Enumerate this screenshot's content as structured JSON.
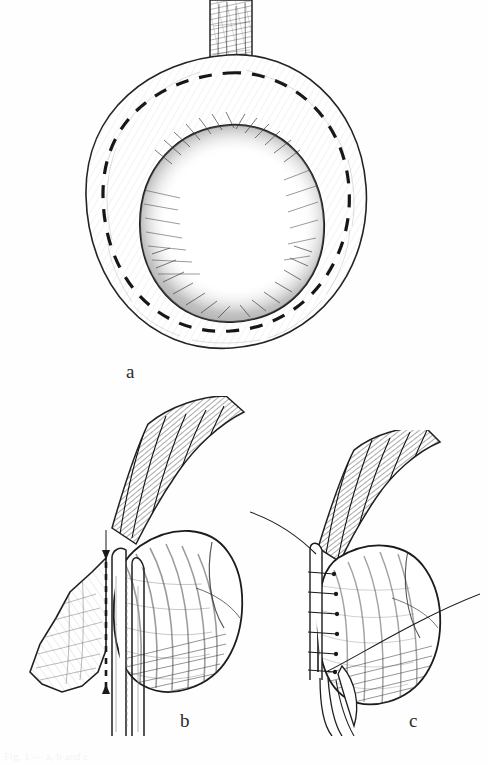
{
  "figure": {
    "kind": "surgical-line-drawing",
    "style": "pen-and-ink hatched anatomical illustration",
    "background_color": "#ffffff",
    "ink_color": "#1a1a1a",
    "panel_count": 3,
    "panels": [
      {
        "id": "a",
        "label": "a",
        "view": "axial / cross-sectional view of a rounded organ encircled by a surrounding cuff of tissue, with a vascular pedicle entering from above",
        "features": [
          "vertical hatched pedicle / stalk entering from top center",
          "central ovoid body with dense stipple shading",
          "outer horseshoe-shaped tissue cuff",
          "dashed incision line following the inner contour of the cuff"
        ],
        "has_dashed_incision_line": true
      },
      {
        "id": "b",
        "label": "b",
        "view": "lateral view with instrument in place; tissue flap retracted to the left of a pair of parallel straight instrument shanks",
        "features": [
          "hatched vascular pedicle entering from upper right",
          "rounded organ body with curved hatching on the right",
          "flat tissue flap on the left",
          "two long parallel straight instrument shanks running vertically",
          "dashed line with small arrowheads at top and bottom indicating the staple / cut line"
        ],
        "has_dashed_incision_line": true,
        "has_arrow_markers": true
      },
      {
        "id": "c",
        "label": "c",
        "view": "lateral view after closure showing a row of interrupted sutures along the cut edge",
        "features": [
          "hatched vascular pedicle entering from upper right",
          "rounded organ body with curved hatching",
          "row of six short transverse sutures along the left margin",
          "long suture tail sweeping up and to the left",
          "long thread sweeping to the right across the body",
          "narrow instrument tip descending below"
        ],
        "has_suture_row": true,
        "suture_count": 6
      }
    ],
    "labels": {
      "a": "a",
      "b": "b",
      "c": "c"
    },
    "caption": {
      "visible": true,
      "legible": false,
      "note": "faint partially cropped line of page text at the very bottom edge",
      "text": "Fig. 1  —  a, b and c"
    }
  }
}
